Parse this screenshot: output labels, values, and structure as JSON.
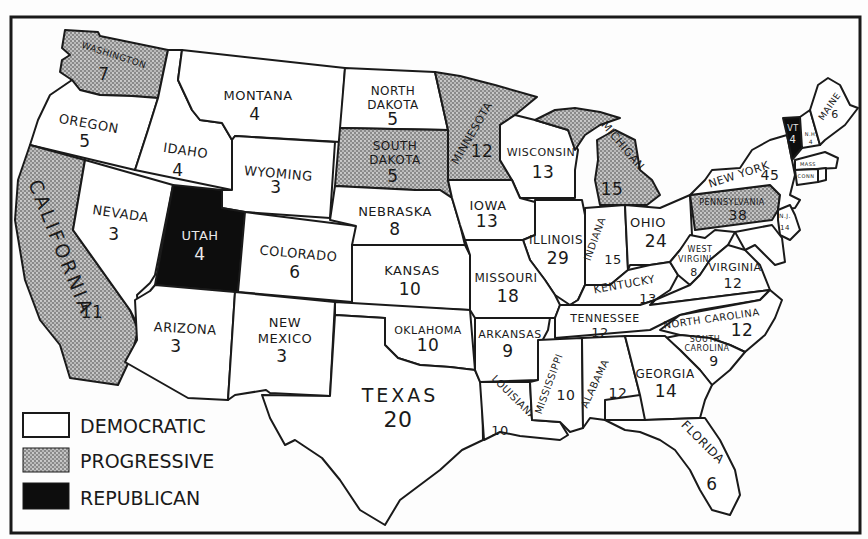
{
  "legend": {
    "democratic": {
      "label": "DEMOCRATIC",
      "color": "#ffffff"
    },
    "progressive": {
      "label": "PROGRESSIVE",
      "color": "stipple-gray"
    },
    "republican": {
      "label": "REPUBLICAN",
      "color": "#0d0d0d"
    }
  },
  "states": {
    "washington": {
      "name": "WASHINGTON",
      "votes": "7",
      "party": "progressive"
    },
    "oregon": {
      "name": "OREGON",
      "votes": "5",
      "party": "democratic"
    },
    "california": {
      "name": "CALIFORNIA",
      "votes": "11",
      "party": "progressive"
    },
    "idaho": {
      "name": "IDAHO",
      "votes": "4",
      "party": "democratic"
    },
    "nevada": {
      "name": "NEVADA",
      "votes": "3",
      "party": "democratic"
    },
    "montana": {
      "name": "MONTANA",
      "votes": "4",
      "party": "democratic"
    },
    "wyoming": {
      "name": "WYOMING",
      "votes": "3",
      "party": "democratic"
    },
    "utah": {
      "name": "UTAH",
      "votes": "4",
      "party": "republican"
    },
    "arizona": {
      "name": "ARIZONA",
      "votes": "3",
      "party": "democratic"
    },
    "colorado": {
      "name": "COLORADO",
      "votes": "6",
      "party": "democratic"
    },
    "new_mexico": {
      "name_line1": "NEW",
      "name_line2": "MEXICO",
      "votes": "3",
      "party": "democratic"
    },
    "north_dakota": {
      "name_line1": "NORTH",
      "name_line2": "DAKOTA",
      "votes": "5",
      "party": "democratic"
    },
    "south_dakota": {
      "name_line1": "SOUTH",
      "name_line2": "DAKOTA",
      "votes": "5",
      "party": "progressive"
    },
    "nebraska": {
      "name": "NEBRASKA",
      "votes": "8",
      "party": "democratic"
    },
    "kansas": {
      "name": "KANSAS",
      "votes": "10",
      "party": "democratic"
    },
    "oklahoma": {
      "name": "OKLAHOMA",
      "votes": "10",
      "party": "democratic"
    },
    "texas": {
      "name": "TEXAS",
      "votes": "20",
      "party": "democratic"
    },
    "minnesota": {
      "name": "MINNESOTA",
      "votes": "12",
      "party": "progressive"
    },
    "iowa": {
      "name": "IOWA",
      "votes": "13",
      "party": "democratic"
    },
    "missouri": {
      "name": "MISSOURI",
      "votes": "18",
      "party": "democratic"
    },
    "arkansas": {
      "name": "ARKANSAS",
      "votes": "9",
      "party": "democratic"
    },
    "louisiana": {
      "name": "LOUISIANA",
      "votes": "10",
      "party": "democratic"
    },
    "wisconsin": {
      "name": "WISCONSIN",
      "votes": "13",
      "party": "democratic"
    },
    "illinois": {
      "name": "ILLINOIS",
      "votes": "29",
      "party": "democratic"
    },
    "michigan": {
      "name": "MICHIGAN",
      "votes": "15",
      "party": "progressive"
    },
    "indiana": {
      "name": "INDIANA",
      "votes": "15",
      "party": "democratic"
    },
    "ohio": {
      "name": "OHIO",
      "votes": "24",
      "party": "democratic"
    },
    "kentucky": {
      "name": "KENTUCKY",
      "votes": "13",
      "party": "democratic"
    },
    "tennessee": {
      "name": "TENNESSEE",
      "votes": "12",
      "party": "democratic"
    },
    "mississippi": {
      "name": "MISSISSIPPI",
      "votes": "10",
      "party": "democratic"
    },
    "alabama": {
      "name": "ALABAMA",
      "votes": "12",
      "party": "democratic"
    },
    "georgia": {
      "name": "GEORGIA",
      "votes": "14",
      "party": "democratic"
    },
    "florida": {
      "name": "FLORIDA",
      "votes": "6",
      "party": "democratic"
    },
    "south_carolina": {
      "name_line1": "SOUTH",
      "name_line2": "CAROLINA",
      "votes": "9",
      "party": "democratic"
    },
    "north_carolina": {
      "name": "NORTH CAROLINA",
      "votes": "12",
      "party": "democratic"
    },
    "virginia": {
      "name": "VIRGINIA",
      "votes": "12",
      "party": "democratic"
    },
    "west_virginia": {
      "name_line1": "WEST",
      "name_line2": "VIRGINIA",
      "votes": "8",
      "party": "democratic"
    },
    "pennsylvania": {
      "name": "PENNSYLVANIA",
      "votes": "38",
      "party": "progressive"
    },
    "new_york": {
      "name": "NEW YORK",
      "votes": "45",
      "party": "democratic"
    },
    "new_jersey": {
      "name": "N.J.",
      "votes": "14",
      "party": "democratic"
    },
    "vermont": {
      "name": "VT",
      "votes": "4",
      "party": "republican"
    },
    "new_hampshire": {
      "name": "N.H.",
      "votes": "4",
      "party": "democratic"
    },
    "maine": {
      "name": "MAINE",
      "votes": "6",
      "party": "democratic"
    },
    "massachusetts": {
      "name": "MASS",
      "votes": "18",
      "party": "democratic"
    },
    "connecticut": {
      "name": "CONN",
      "votes": "7",
      "party": "democratic"
    },
    "rhode_island": {
      "name": "R.I.",
      "votes": "5",
      "party": "democratic"
    }
  }
}
